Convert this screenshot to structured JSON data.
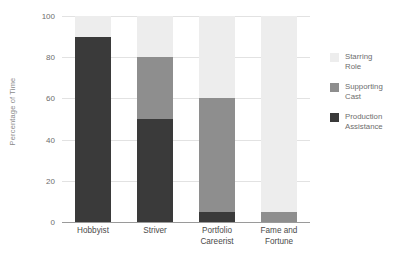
{
  "chart_data": {
    "type": "bar",
    "stacked": true,
    "title": "",
    "xlabel": "",
    "ylabel": "Percentage of Time",
    "categories": [
      "Hobbyist",
      "Striver",
      "Portfolio Careerist",
      "Fame and Fortune"
    ],
    "category_lines": [
      [
        "Hobbyist"
      ],
      [
        "Striver"
      ],
      [
        "Portfolio",
        "Careerist"
      ],
      [
        "Fame and",
        "Fortune"
      ]
    ],
    "series": [
      {
        "name": "Production Assistance",
        "values": [
          90,
          50,
          5,
          0
        ],
        "color": "#3a3a3a"
      },
      {
        "name": "Supporting Cast",
        "values": [
          0,
          30,
          55,
          5
        ],
        "color": "#8e8e8e"
      },
      {
        "name": "Starring Role",
        "values": [
          10,
          20,
          40,
          95
        ],
        "color": "#ededed"
      }
    ],
    "ylim": [
      0,
      100
    ],
    "yticks": [
      0,
      20,
      40,
      60,
      80,
      100
    ],
    "ytick_labels": [
      "0",
      "20",
      "40",
      "60",
      "80",
      "100"
    ],
    "grid": true,
    "legend_position": "right",
    "legend_order": [
      "Starring Role",
      "Supporting Cast",
      "Production Assistance"
    ]
  },
  "legend": {
    "items": [
      {
        "label": "Starring\nRole",
        "series": "Starring Role",
        "color": "#ededed"
      },
      {
        "label": "Supporting\nCast",
        "series": "Supporting Cast",
        "color": "#8e8e8e"
      },
      {
        "label": "Production\nAssistance",
        "series": "Production Assistance",
        "color": "#3a3a3a"
      }
    ]
  },
  "axis": {
    "y_title": "Percentage of Time"
  },
  "colors": {
    "gridline": "#e2e2e2",
    "baseline": "#9a9a9a",
    "tick_text": "#6d6d6d",
    "x_tick_text": "#4a4a4a",
    "background": "#ffffff"
  }
}
